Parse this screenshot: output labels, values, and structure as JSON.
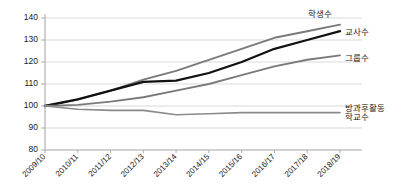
{
  "chart_data": {
    "type": "line",
    "title": "",
    "xlabel": "",
    "ylabel": "",
    "ylim": [
      80,
      140
    ],
    "ytick_step": 10,
    "grid": true,
    "legend": "inline-right-labels",
    "yticks": [
      "80",
      "90",
      "100",
      "110",
      "120",
      "130",
      "140"
    ],
    "categories": [
      "2009/10",
      "2010/11",
      "2011/12",
      "2012/13",
      "2013/14",
      "2014/15",
      "2015/16",
      "2016/17",
      "2017/18",
      "2018/19"
    ],
    "series": [
      {
        "name": "학생수",
        "color": "#7a7a7a",
        "width": 1.9,
        "values": [
          100,
          103,
          107,
          112,
          116,
          121,
          126,
          131,
          134,
          137
        ]
      },
      {
        "name": "교사수",
        "color": "#111111",
        "width": 2.3,
        "values": [
          100,
          103,
          107,
          111,
          111.5,
          115,
          120,
          126,
          130,
          134
        ]
      },
      {
        "name": "그룹수",
        "color": "#7a7a7a",
        "width": 1.9,
        "values": [
          100,
          100.5,
          102,
          104,
          107,
          110,
          114,
          118,
          121,
          123
        ]
      },
      {
        "name": "방과후활동 학교수",
        "color": "#8a8a8a",
        "width": 1.6,
        "values": [
          100,
          98.5,
          98,
          98,
          96,
          96.5,
          97,
          97,
          97,
          97
        ]
      }
    ],
    "series_labels": [
      {
        "text": "학생수",
        "x": 308,
        "y": 17
      },
      {
        "text": "교사수",
        "x": 345,
        "y": 35
      },
      {
        "text": "그룹수",
        "x": 345,
        "y": 61
      },
      {
        "text": "방과후활동",
        "x": 345,
        "y": 111
      },
      {
        "text": "학교수",
        "x": 345,
        "y": 120
      }
    ]
  }
}
